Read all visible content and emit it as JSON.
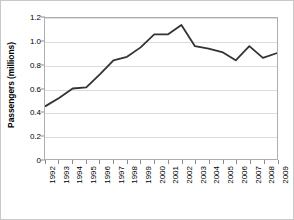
{
  "chart_data": {
    "type": "line",
    "title": "",
    "xlabel": "",
    "ylabel": "Passengers (millions)",
    "categories": [
      "1992",
      "1993",
      "1994",
      "1995",
      "1996",
      "1997",
      "1998",
      "1999",
      "2000",
      "2001",
      "2002",
      "2003",
      "2004",
      "2005",
      "2006",
      "2007",
      "2008",
      "2009"
    ],
    "values": [
      0.45,
      0.52,
      0.6,
      0.61,
      0.72,
      0.84,
      0.87,
      0.95,
      1.06,
      1.06,
      1.14,
      0.96,
      0.94,
      0.91,
      0.84,
      0.96,
      0.86,
      0.9
    ],
    "series": [
      {
        "name": "Passengers",
        "color": "#333333",
        "values": [
          0.45,
          0.52,
          0.6,
          0.61,
          0.72,
          0.84,
          0.87,
          0.95,
          1.06,
          1.06,
          1.14,
          0.96,
          0.94,
          0.91,
          0.84,
          0.96,
          0.86,
          0.9
        ]
      }
    ],
    "ylim": [
      0,
      1.2
    ],
    "yticks": [
      "0",
      "0.2",
      "0.4",
      "0.6",
      "0.8",
      "1.0",
      "1.2"
    ],
    "ytick_values": [
      0,
      0.2,
      0.4,
      0.6,
      0.8,
      1.0,
      1.2
    ],
    "grid": true,
    "grid_axis": "y",
    "grid_color": "#dcdcdc",
    "legend": "none",
    "line_color": "#333333",
    "line_width": 1.8,
    "plot_border_color": "#aeaeae",
    "background": "#ffffff",
    "figure_border_color": "#c8c8c8"
  }
}
